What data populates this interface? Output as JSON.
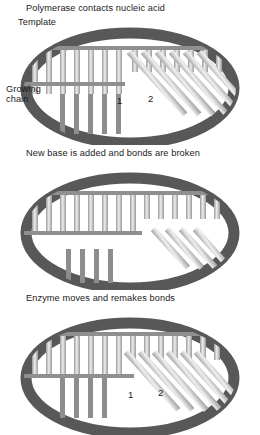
{
  "figure": {
    "colors": {
      "enzyme_ring": "#585858",
      "background": "#ffffff",
      "bar_dark": "#8c8c8c",
      "bar_light": "#e8e8e8",
      "strand_line": "#6e6e6e",
      "text": "#1a1a1a"
    }
  },
  "panels": [
    {
      "id": "panel-1",
      "title": "Polymerase contacts nucleic acid",
      "labels": {
        "template": "Template",
        "growing_chain_line1": "Growing",
        "growing_chain_line2": "chain",
        "site_1": "1",
        "site_2": "2"
      }
    },
    {
      "id": "panel-2",
      "title": "New base is added and bonds are broken",
      "labels": {}
    },
    {
      "id": "panel-3",
      "title": "Enzyme moves and remakes bonds",
      "labels": {
        "site_1": "1",
        "site_2": "2"
      }
    }
  ]
}
